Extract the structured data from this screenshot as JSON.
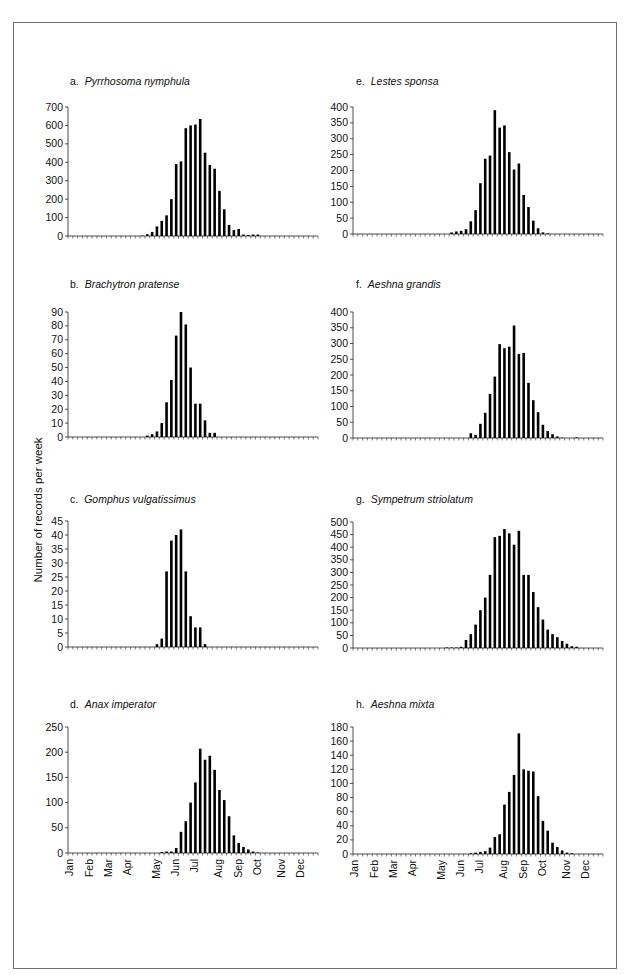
{
  "figure": {
    "y_axis_label": "Number of records per week",
    "month_labels": [
      "Jan",
      "Feb",
      "Mar",
      "Apr",
      "May",
      "Jun",
      "Jul",
      "Aug",
      "Sep",
      "Oct",
      "Nov",
      "Dec"
    ],
    "month_label_weeks": [
      0,
      4,
      8,
      12,
      18,
      22,
      26,
      31,
      35,
      39,
      44,
      48
    ],
    "bar_color": "#000000"
  },
  "chart_data": [
    {
      "type": "bar",
      "panel": "a",
      "title": "Pyrrhosoma nymphula",
      "xlabel": "Week of year",
      "ylabel": "Number of records per week",
      "ylim": [
        0,
        700
      ],
      "yticks": [
        0,
        100,
        200,
        300,
        400,
        500,
        600,
        700
      ],
      "start_week": 15,
      "values": [
        2,
        10,
        22,
        52,
        82,
        112,
        200,
        390,
        405,
        585,
        600,
        605,
        635,
        452,
        385,
        365,
        245,
        145,
        60,
        32,
        38,
        8,
        5,
        8,
        8
      ]
    },
    {
      "type": "bar",
      "panel": "b",
      "title": "Brachytron pratense",
      "xlabel": "Week of year",
      "ylabel": "Number of records per week",
      "ylim": [
        0,
        90
      ],
      "yticks": [
        0,
        10,
        20,
        30,
        40,
        50,
        60,
        70,
        80,
        90
      ],
      "start_week": 16,
      "values": [
        1,
        2,
        4,
        10,
        25,
        41,
        73,
        90,
        81,
        50,
        24,
        24,
        12,
        3,
        3
      ]
    },
    {
      "type": "bar",
      "panel": "c",
      "title": "Gomphus vulgatissimus",
      "xlabel": "Week of year",
      "ylabel": "Number of records per week",
      "ylim": [
        0,
        45
      ],
      "yticks": [
        0,
        5,
        10,
        15,
        20,
        25,
        30,
        35,
        40,
        45
      ],
      "start_week": 18,
      "values": [
        1,
        3,
        27,
        38,
        40,
        42,
        27,
        11,
        7,
        7,
        1
      ]
    },
    {
      "type": "bar",
      "panel": "d",
      "title": "Anax imperator",
      "xlabel": "Week of year",
      "ylabel": "Number of records per week",
      "ylim": [
        0,
        250
      ],
      "yticks": [
        0,
        50,
        100,
        150,
        200,
        250
      ],
      "start_week": 19,
      "values": [
        2,
        3,
        3,
        10,
        42,
        63,
        100,
        140,
        207,
        185,
        193,
        165,
        125,
        105,
        73,
        35,
        20,
        12,
        7,
        3,
        1
      ]
    },
    {
      "type": "bar",
      "panel": "e",
      "title": "Lestes sponsa",
      "xlabel": "Week of year",
      "ylabel": "Number of records per week",
      "ylim": [
        0,
        400
      ],
      "yticks": [
        0,
        50,
        100,
        150,
        200,
        250,
        300,
        350,
        400
      ],
      "start_week": 20,
      "values": [
        5,
        8,
        10,
        15,
        40,
        75,
        160,
        237,
        247,
        390,
        335,
        342,
        258,
        203,
        222,
        123,
        85,
        42,
        18,
        5,
        2
      ]
    },
    {
      "type": "bar",
      "panel": "f",
      "title": "Aeshna grandis",
      "xlabel": "Week of year",
      "ylabel": "Number of records per week",
      "ylim": [
        0,
        400
      ],
      "yticks": [
        0,
        50,
        100,
        150,
        200,
        250,
        300,
        350,
        400
      ],
      "start_week": 24,
      "values": [
        15,
        10,
        45,
        80,
        140,
        195,
        298,
        285,
        290,
        357,
        267,
        270,
        175,
        120,
        82,
        42,
        22,
        12,
        5,
        1,
        0,
        0,
        2
      ]
    },
    {
      "type": "bar",
      "panel": "g",
      "title": "Sympetrum striolatum",
      "xlabel": "Week of year",
      "ylabel": "Number of records per week",
      "ylim": [
        0,
        500
      ],
      "yticks": [
        0,
        50,
        100,
        150,
        200,
        250,
        300,
        350,
        400,
        450,
        500
      ],
      "start_week": 19,
      "values": [
        2,
        2,
        2,
        5,
        32,
        55,
        93,
        150,
        200,
        290,
        440,
        445,
        472,
        455,
        410,
        465,
        290,
        290,
        222,
        162,
        113,
        73,
        55,
        43,
        28,
        17,
        7,
        5
      ]
    },
    {
      "type": "bar",
      "panel": "h",
      "title": "Aeshna mixta",
      "xlabel": "Week of year",
      "ylabel": "Number of records per week",
      "ylim": [
        0,
        180
      ],
      "yticks": [
        0,
        20,
        40,
        60,
        80,
        100,
        120,
        140,
        160,
        180
      ],
      "start_week": 24,
      "values": [
        1,
        2,
        3,
        4,
        9,
        24,
        28,
        70,
        88,
        112,
        171,
        120,
        118,
        117,
        82,
        47,
        33,
        16,
        10,
        5,
        2,
        1
      ]
    }
  ],
  "panels": [
    {
      "letter": "a.",
      "species": "Pyrrhosoma nymphula"
    },
    {
      "letter": "b.",
      "species": "Brachytron pratense"
    },
    {
      "letter": "c.",
      "species": "Gomphus vulgatissimus"
    },
    {
      "letter": "d.",
      "species": "Anax imperator"
    },
    {
      "letter": "e.",
      "species": "Lestes sponsa"
    },
    {
      "letter": "f.",
      "species": "Aeshna grandis"
    },
    {
      "letter": "g.",
      "species": "Sympetrum striolatum"
    },
    {
      "letter": "h.",
      "species": "Aeshna mixta"
    }
  ]
}
